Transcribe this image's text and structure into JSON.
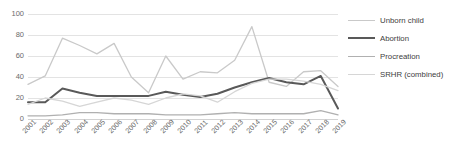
{
  "chart_data": {
    "type": "line",
    "title": "",
    "xlabel": "",
    "ylabel": "",
    "ylim": [
      0,
      100
    ],
    "yticks": [
      100,
      80,
      60,
      40,
      20,
      0
    ],
    "grid": true,
    "legend_position": "right",
    "categories": [
      "2001",
      "2002",
      "2003",
      "2004",
      "2005",
      "2006",
      "2007",
      "2008",
      "2009",
      "2010",
      "2011",
      "2012",
      "2013",
      "2014",
      "2015",
      "2016",
      "2017",
      "2018",
      "2019"
    ],
    "series": [
      {
        "name": "Unborn child",
        "color": "#c9c9c9",
        "values": [
          33,
          41,
          77,
          70,
          62,
          72,
          40,
          25,
          60,
          38,
          45,
          44,
          56,
          88,
          35,
          31,
          45,
          46,
          31
        ]
      },
      {
        "name": "Abortion",
        "color": "#595959",
        "values": [
          16,
          16,
          29,
          25,
          22,
          22,
          22,
          22,
          26,
          23,
          21,
          24,
          30,
          35,
          39,
          35,
          33,
          41,
          10
        ]
      },
      {
        "name": "Procreation",
        "color": "#b0b0b0",
        "values": [
          3,
          3,
          4,
          6,
          6,
          5,
          5,
          5,
          4,
          4,
          4,
          5,
          6,
          5,
          5,
          5,
          5,
          8,
          4
        ]
      },
      {
        "name": "SRHR (combined)",
        "color": "#d6d6d6",
        "values": [
          14,
          20,
          17,
          12,
          16,
          20,
          18,
          14,
          20,
          24,
          22,
          16,
          26,
          34,
          38,
          38,
          36,
          33,
          27
        ]
      }
    ]
  },
  "legend": {
    "items": [
      {
        "label": "Unborn child"
      },
      {
        "label": "Abortion"
      },
      {
        "label": "Procreation"
      },
      {
        "label": "SRHR (combined)"
      }
    ]
  }
}
